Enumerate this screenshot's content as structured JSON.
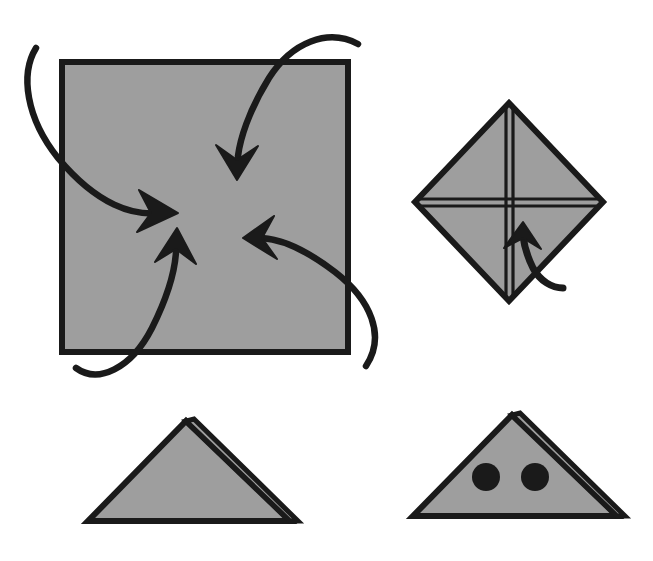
{
  "document": {
    "title": "Origami folding instruction diagram",
    "kind": "instructional-line-drawing",
    "panel_count": 4,
    "background_color": "#ffffff"
  },
  "palette": {
    "paper_fill": "#9e9e9e",
    "paper_fill_light": "#a6a6a6",
    "outline": "#1a1a1a",
    "arrow": "#1a1a1a",
    "dot": "#1a1a1a",
    "background": "#ffffff"
  },
  "panels": [
    {
      "id": "panel-square-corners-in",
      "name": "square-with-inward-fold-arrows",
      "position": "top-left",
      "step_number": 1,
      "shape": {
        "type": "square",
        "x": 62,
        "y": 62,
        "width": 286,
        "height": 290,
        "fill": "#9e9e9e",
        "stroke": "#1a1a1a",
        "stroke_width": 6
      },
      "arrow_count": 4,
      "arrows": [
        {
          "name": "arrow-top-left-corner-in",
          "from_corner": "top-left",
          "direction": "down-right",
          "path": "M 36 50 C 22 78, 30 122, 62 160 C 104 208, 140 216, 168 212",
          "head": {
            "x": 170,
            "y": 212,
            "angle": -8
          }
        },
        {
          "name": "arrow-top-right-corner-in",
          "from_corner": "top-right",
          "direction": "down-left",
          "path": "M 355 44 C 326 30, 292 44, 268 80 C 244 118, 238 142, 236 160",
          "head": {
            "x": 235,
            "y": 163,
            "angle": 98
          }
        },
        {
          "name": "arrow-bottom-left-corner-in",
          "from_corner": "bottom-left",
          "direction": "up-right",
          "path": "M 78 366 C 98 382, 130 370, 152 330 C 170 296, 175 266, 176 248",
          "head": {
            "x": 176,
            "y": 244,
            "angle": -82
          }
        },
        {
          "name": "arrow-bottom-right-corner-in",
          "from_corner": "bottom-right",
          "direction": "up-left",
          "path": "M 368 364 C 386 336, 372 300, 336 272 C 300 246, 276 240, 260 238",
          "head": {
            "x": 256,
            "y": 237,
            "angle": 188
          }
        }
      ]
    },
    {
      "id": "panel-diamond-cross",
      "name": "diamond-with-cross-creases",
      "position": "top-right",
      "step_number": 2,
      "shape": {
        "type": "diamond",
        "center_x": 509,
        "center_y": 202,
        "half_width": 94,
        "half_height": 99,
        "fill": "#9e9e9e",
        "stroke": "#1a1a1a",
        "stroke_width": 6
      },
      "crease_lines": [
        {
          "name": "crease-vertical",
          "orientation": "vertical",
          "style": "double-line"
        },
        {
          "name": "crease-horizontal",
          "orientation": "horizontal",
          "style": "double-line"
        }
      ],
      "arrows": [
        {
          "name": "arrow-fold-up",
          "direction": "up",
          "path": "M 555 285 C 547 276, 533 276, 528 262 C 524 250, 523 240, 523 232",
          "head": {
            "x": 523,
            "y": 228,
            "angle": -90
          }
        }
      ]
    },
    {
      "id": "panel-triangle-plain",
      "name": "folded-triangle-plain",
      "position": "bottom-left",
      "step_number": 3,
      "shape": {
        "type": "triangle",
        "apex_x": 186,
        "apex_y": 421,
        "left_x": 88,
        "right_x": 290,
        "base_y": 521,
        "fill": "#9e9e9e",
        "stroke": "#1a1a1a",
        "stroke_width": 6
      },
      "flap": {
        "name": "layer-flap-right",
        "description": "thin parallel layer edge along right side",
        "visible": true
      },
      "dots": []
    },
    {
      "id": "panel-triangle-eyes",
      "name": "folded-triangle-with-eyes",
      "position": "bottom-right",
      "step_number": 4,
      "shape": {
        "type": "triangle",
        "apex_x": 512,
        "apex_y": 415,
        "left_x": 413,
        "right_x": 617,
        "base_y": 516,
        "fill": "#9e9e9e",
        "stroke": "#1a1a1a",
        "stroke_width": 6
      },
      "flap": {
        "name": "layer-flap-right",
        "description": "thin parallel layer edge along right side",
        "visible": true
      },
      "dots": [
        {
          "name": "eye-dot-left",
          "cx": 486,
          "cy": 477,
          "r": 14,
          "fill": "#1a1a1a"
        },
        {
          "name": "eye-dot-right",
          "cx": 535,
          "cy": 477,
          "r": 14,
          "fill": "#1a1a1a"
        }
      ]
    }
  ]
}
